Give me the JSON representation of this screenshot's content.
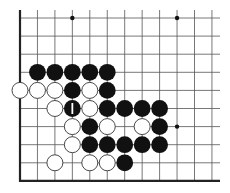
{
  "board": {
    "origin_x": 20,
    "origin_y": 18,
    "spacing_x": 17.45,
    "spacing_y": 18.1,
    "cols": 12,
    "rows": 10,
    "line_color": "#555555",
    "edge_color": "#222222",
    "edges": {
      "left": true,
      "bottom": true,
      "top": false,
      "right": false
    },
    "line_extent": {
      "x_end": 220,
      "y_start": 10
    },
    "star_points": [
      {
        "row": 0,
        "col": 3
      },
      {
        "row": 0,
        "col": 9
      },
      {
        "row": 6,
        "col": 9
      }
    ]
  },
  "stones": [
    {
      "color": "black",
      "row": 3,
      "col": 1
    },
    {
      "color": "black",
      "row": 3,
      "col": 2
    },
    {
      "color": "black",
      "row": 3,
      "col": 3
    },
    {
      "color": "black",
      "row": 3,
      "col": 4
    },
    {
      "color": "black",
      "row": 3,
      "col": 5
    },
    {
      "color": "white",
      "row": 4,
      "col": 0
    },
    {
      "color": "white",
      "row": 4,
      "col": 1
    },
    {
      "color": "white",
      "row": 4,
      "col": 2
    },
    {
      "color": "black",
      "row": 4,
      "col": 3
    },
    {
      "color": "white",
      "row": 4,
      "col": 4
    },
    {
      "color": "black",
      "row": 4,
      "col": 5
    },
    {
      "color": "white",
      "row": 5,
      "col": 2
    },
    {
      "color": "black",
      "row": 5,
      "col": 3,
      "marker": "bar"
    },
    {
      "color": "white",
      "row": 5,
      "col": 4
    },
    {
      "color": "black",
      "row": 5,
      "col": 5
    },
    {
      "color": "black",
      "row": 5,
      "col": 6
    },
    {
      "color": "black",
      "row": 5,
      "col": 7
    },
    {
      "color": "black",
      "row": 5,
      "col": 8
    },
    {
      "color": "white",
      "row": 6,
      "col": 3
    },
    {
      "color": "black",
      "row": 6,
      "col": 4
    },
    {
      "color": "white",
      "row": 6,
      "col": 5
    },
    {
      "color": "white",
      "row": 6,
      "col": 7
    },
    {
      "color": "black",
      "row": 6,
      "col": 8
    },
    {
      "color": "white",
      "row": 7,
      "col": 3
    },
    {
      "color": "black",
      "row": 7,
      "col": 4
    },
    {
      "color": "black",
      "row": 7,
      "col": 5
    },
    {
      "color": "black",
      "row": 7,
      "col": 6
    },
    {
      "color": "black",
      "row": 7,
      "col": 7
    },
    {
      "color": "black",
      "row": 7,
      "col": 8
    },
    {
      "color": "white",
      "row": 8,
      "col": 2
    },
    {
      "color": "white",
      "row": 8,
      "col": 4
    },
    {
      "color": "white",
      "row": 8,
      "col": 5
    },
    {
      "color": "black",
      "row": 8,
      "col": 6
    }
  ],
  "colors": {
    "black_stone": "#111111",
    "white_stone_fill": "#ffffff",
    "white_stone_stroke": "#333333",
    "marker": "#ffffff"
  }
}
